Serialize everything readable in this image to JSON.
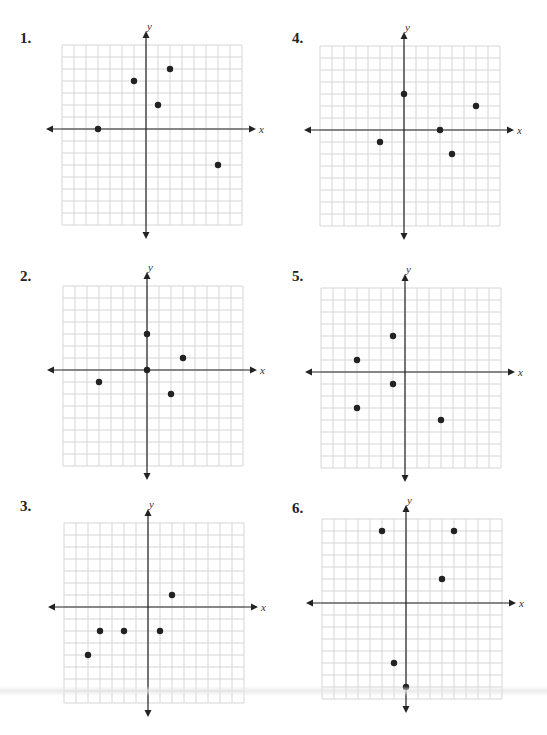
{
  "chart_data": [
    {
      "type": "scatter",
      "label": "1.",
      "xlabel": "x",
      "ylabel": "y",
      "xlim": [
        -7,
        8
      ],
      "ylim": [
        -8,
        7
      ],
      "grid": true,
      "points": [
        [
          -4,
          0
        ],
        [
          -1,
          4
        ],
        [
          1,
          2
        ],
        [
          2,
          5
        ],
        [
          6,
          -3
        ]
      ]
    },
    {
      "type": "scatter",
      "label": "2.",
      "xlabel": "x",
      "ylabel": "y",
      "xlim": [
        -7,
        8
      ],
      "ylim": [
        -8,
        7
      ],
      "grid": true,
      "points": [
        [
          0,
          3
        ],
        [
          3,
          1
        ],
        [
          0,
          0
        ],
        [
          -4,
          -1
        ],
        [
          2,
          -2
        ]
      ]
    },
    {
      "type": "scatter",
      "label": "3.",
      "xlabel": "x",
      "ylabel": "y",
      "xlim": [
        -7,
        8
      ],
      "ylim": [
        -8,
        7
      ],
      "grid": true,
      "points": [
        [
          2,
          1
        ],
        [
          -4,
          -2
        ],
        [
          -2,
          -2
        ],
        [
          1,
          -2
        ],
        [
          -5,
          -4
        ]
      ]
    },
    {
      "type": "scatter",
      "label": "4.",
      "xlabel": "x",
      "ylabel": "y",
      "xlim": [
        -7,
        8
      ],
      "ylim": [
        -8,
        7
      ],
      "grid": true,
      "points": [
        [
          0,
          3
        ],
        [
          6,
          2
        ],
        [
          3,
          0
        ],
        [
          -2,
          -1
        ],
        [
          4,
          -2
        ]
      ]
    },
    {
      "type": "scatter",
      "label": "5.",
      "xlabel": "x",
      "ylabel": "y",
      "xlim": [
        -7,
        8
      ],
      "ylim": [
        -8,
        7
      ],
      "grid": true,
      "points": [
        [
          -1,
          3
        ],
        [
          -4,
          1
        ],
        [
          -1,
          -1
        ],
        [
          -4,
          -3
        ],
        [
          3,
          -4
        ]
      ]
    },
    {
      "type": "scatter",
      "label": "6.",
      "xlabel": "x",
      "ylabel": "y",
      "xlim": [
        -7,
        8
      ],
      "ylim": [
        -8,
        7
      ],
      "grid": true,
      "points": [
        [
          -2,
          6
        ],
        [
          4,
          6
        ],
        [
          3,
          2
        ],
        [
          -1,
          -5
        ],
        [
          0,
          -7
        ]
      ]
    }
  ],
  "panels": [
    {
      "id": "1",
      "left": 20,
      "top": 30,
      "origin": [
        126,
        99
      ]
    },
    {
      "id": "2",
      "left": 20,
      "top": 268,
      "origin": [
        127,
        102
      ]
    },
    {
      "id": "3",
      "left": 20,
      "top": 498,
      "origin": [
        128,
        109
      ]
    },
    {
      "id": "4",
      "left": 292,
      "top": 30,
      "origin": [
        112,
        100
      ]
    },
    {
      "id": "5",
      "left": 292,
      "top": 268,
      "origin": [
        113,
        104
      ]
    },
    {
      "id": "6",
      "left": 292,
      "top": 500,
      "origin": [
        114,
        103
      ]
    }
  ],
  "colors": {
    "grid": "#d6d6d6",
    "axis": "#222222",
    "point": "#222222"
  }
}
